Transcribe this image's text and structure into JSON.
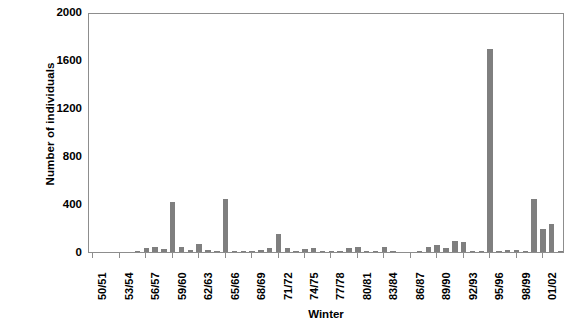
{
  "chart_data": {
    "type": "bar",
    "title": "",
    "xlabel": "Winter",
    "ylabel": "Number of individuals",
    "ylim": [
      0,
      2000
    ],
    "yticks": [
      0,
      400,
      800,
      1200,
      1600,
      2000
    ],
    "grid": false,
    "legend": "none",
    "bar_color": "#7f7f7f",
    "axis_color": "#8d8d8d",
    "xtick_labels": [
      "50/51",
      "53/54",
      "56/57",
      "59/60",
      "62/63",
      "65/66",
      "68/69",
      "71/72",
      "74/75",
      "77/78",
      "80/81",
      "83/84",
      "86/87",
      "89/90",
      "92/93",
      "95/96",
      "98/99",
      "01/02"
    ],
    "xtick_interval_years": 3,
    "categories": [
      "50/51",
      "51/52",
      "52/53",
      "53/54",
      "54/55",
      "55/56",
      "56/57",
      "57/58",
      "58/59",
      "59/60",
      "60/61",
      "61/62",
      "62/63",
      "63/64",
      "64/65",
      "65/66",
      "66/67",
      "67/68",
      "68/69",
      "69/70",
      "70/71",
      "71/72",
      "72/73",
      "73/74",
      "74/75",
      "75/76",
      "76/77",
      "77/78",
      "78/79",
      "79/80",
      "80/81",
      "81/82",
      "82/83",
      "83/84",
      "84/85",
      "85/86",
      "86/87",
      "87/88",
      "88/89",
      "89/90",
      "90/91",
      "91/92",
      "92/93",
      "93/94",
      "94/95",
      "95/96",
      "96/97",
      "97/98",
      "98/99",
      "99/00",
      "00/01",
      "01/02",
      "02/03",
      "03/04"
    ],
    "values": [
      0,
      0,
      0,
      0,
      0,
      3,
      30,
      45,
      25,
      415,
      40,
      20,
      65,
      15,
      8,
      440,
      10,
      5,
      5,
      20,
      30,
      150,
      30,
      10,
      25,
      30,
      10,
      8,
      10,
      30,
      40,
      5,
      5,
      40,
      5,
      0,
      0,
      8,
      40,
      60,
      30,
      95,
      85,
      10,
      10,
      1690,
      10,
      20,
      15,
      5,
      440,
      195,
      230,
      10
    ]
  }
}
